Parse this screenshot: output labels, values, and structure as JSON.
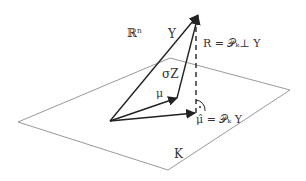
{
  "diagram": {
    "labels": {
      "space": "ℝⁿ",
      "y": "Y",
      "residual": "R = 𝒫ₖ⊥ Y",
      "noise": "σZ",
      "mu": "μ",
      "mu_hat": "μ̂ = 𝒫ₖ Y",
      "cone": "K"
    },
    "colors": {
      "plane": "#9a9a9a",
      "vectors": "#222222",
      "text": "#333333"
    }
  }
}
